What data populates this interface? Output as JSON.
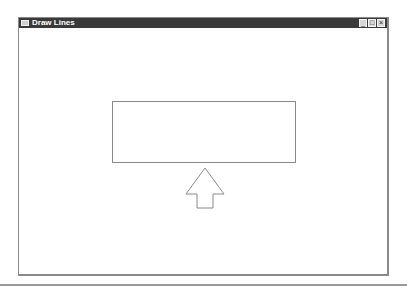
{
  "window": {
    "title": "Draw Lines",
    "controls": {
      "minimize": "_",
      "maximize": "□",
      "close": "×"
    }
  },
  "canvas": {
    "shapes": [
      {
        "type": "rectangle",
        "x": 112,
        "y": 91,
        "width": 184,
        "height": 62
      },
      {
        "type": "up-arrow",
        "tip_x": 204,
        "tip_y": 157,
        "bottom_y": 197
      }
    ]
  }
}
